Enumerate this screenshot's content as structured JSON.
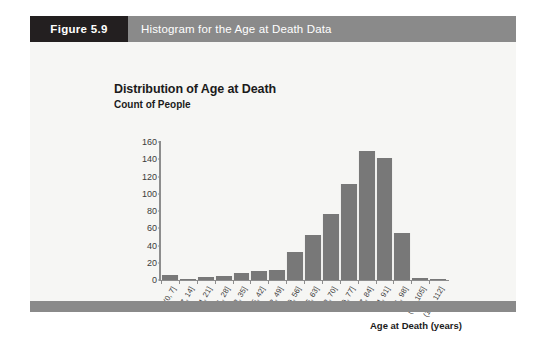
{
  "figure": {
    "number_label": "Figure 5.9",
    "caption": "Histogram for the Age at Death Data",
    "header_bg": "#8a8a8a",
    "number_bg": "#231f20",
    "body_bg": "#f6f6f4"
  },
  "chart_data": {
    "type": "bar",
    "title": "Distribution of Age at Death",
    "xlabel": "Age at Death (years)",
    "ylabel": "Count of People",
    "ylim": [
      0,
      160
    ],
    "yticks": [
      0,
      20,
      40,
      60,
      80,
      100,
      120,
      140,
      160
    ],
    "grid": false,
    "legend": null,
    "bar_color": "#787878",
    "axis_color": "#8d8d8d",
    "categories": [
      "(0, 7]",
      "(7, 14]",
      "(14, 21]",
      "(21, 28]",
      "(28, 35]",
      "(35, 42]",
      "(42, 49]",
      "(49, 56]",
      "(56, 63]",
      "(63, 70]",
      "(70, 77]",
      "(77, 84]",
      "(84, 91]",
      "(91, 98]",
      "(98, 105]",
      "(105, 112]"
    ],
    "values": [
      6,
      1,
      4,
      5,
      8,
      11,
      12,
      33,
      52,
      76,
      111,
      150,
      141,
      55,
      2,
      1
    ]
  }
}
